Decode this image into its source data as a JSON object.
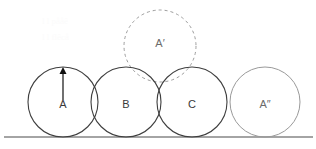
{
  "figure": {
    "canvas": {
      "width": 316,
      "height": 149,
      "background": "#ffffff"
    },
    "ground": {
      "label": "ground-line",
      "x1": 4,
      "y1": 137,
      "x2": 313,
      "y2": 137,
      "color": "#4a4a4a",
      "stroke_width": 1.1
    },
    "circles": [
      {
        "id": "circle-a",
        "label": "A",
        "cx": 63,
        "cy": 102,
        "r": 35,
        "style": "solid",
        "color": "#3f3f3f",
        "stroke_width": 1.1,
        "label_x": 63,
        "label_y": 105
      },
      {
        "id": "circle-b",
        "label": "B",
        "cx": 126,
        "cy": 102,
        "r": 35,
        "style": "solid",
        "color": "#3f3f3f",
        "stroke_width": 1.1,
        "label_x": 126,
        "label_y": 105
      },
      {
        "id": "circle-c",
        "label": "C",
        "cx": 192,
        "cy": 102,
        "r": 35,
        "style": "solid",
        "color": "#3f3f3f",
        "stroke_width": 1.1,
        "label_x": 192,
        "label_y": 105
      },
      {
        "id": "circle-a-double-prime",
        "label": "A″",
        "cx": 265,
        "cy": 102,
        "r": 35,
        "style": "solid",
        "color": "#9a9a9a",
        "stroke_width": 1.0,
        "label_x": 265,
        "label_y": 105
      }
    ],
    "dashed_circle": {
      "id": "circle-a-prime",
      "label": "A′",
      "cx": 160,
      "cy": 46,
      "r": 36,
      "style": "dashed",
      "color": "#9d9d9d",
      "stroke_width": 1.0,
      "dash_pattern": "3,3",
      "label_x": 160,
      "label_y": 44
    },
    "arrow": {
      "id": "arrow-up-in-a",
      "direction": "up",
      "x": 63,
      "tail_y": 100,
      "head_y": 67,
      "color": "#111111",
      "stroke_width": 1.2,
      "head_width": 7,
      "head_height": 7
    },
    "ghost_text_lines": [
      {
        "text": "l   l   pååê",
        "x": 42,
        "y": 24
      },
      {
        "text": "l   l   flêcå",
        "x": 42,
        "y": 40
      }
    ]
  }
}
